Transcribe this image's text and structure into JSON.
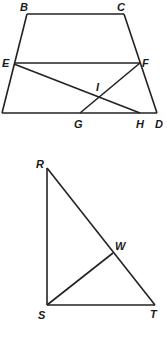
{
  "figure1": {
    "name": "trapezoid",
    "labels": {
      "B": "B",
      "C": "C",
      "E": "E",
      "F": "F",
      "I": "I",
      "G": "G",
      "H": "H",
      "D": "D"
    },
    "points": {
      "A": [
        2,
        113
      ],
      "B": [
        27,
        14
      ],
      "C": [
        124,
        14
      ],
      "D": [
        157,
        113
      ],
      "E": [
        14,
        63
      ],
      "F": [
        140,
        63
      ],
      "G": [
        80,
        113
      ],
      "H": [
        140,
        113
      ],
      "I": [
        99,
        97
      ]
    },
    "segments": [
      [
        "A",
        "B"
      ],
      [
        "B",
        "C"
      ],
      [
        "C",
        "D"
      ],
      [
        "A",
        "D"
      ],
      [
        "E",
        "F"
      ],
      [
        "E",
        "H"
      ],
      [
        "F",
        "G"
      ]
    ]
  },
  "figure2": {
    "name": "right-triangle",
    "labels": {
      "R": "R",
      "S": "S",
      "T": "T",
      "W": "W"
    },
    "points": {
      "R": [
        47,
        168
      ],
      "S": [
        47,
        305
      ],
      "T": [
        155,
        305
      ],
      "W": [
        113,
        253
      ]
    },
    "segments": [
      [
        "R",
        "S"
      ],
      [
        "S",
        "T"
      ],
      [
        "R",
        "T"
      ],
      [
        "S",
        "W"
      ]
    ]
  }
}
